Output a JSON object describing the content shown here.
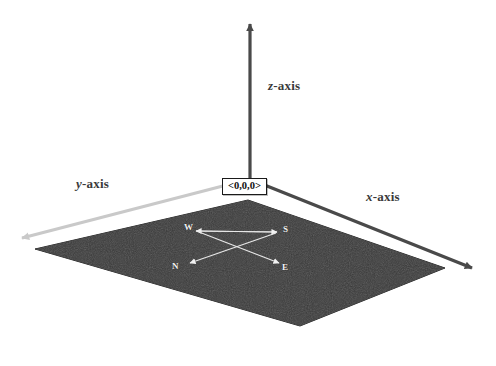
{
  "figure": {
    "type": "3d-coordinate-system-diagram",
    "background_color": "#ffffff"
  },
  "origin": {
    "name": "origin-marker",
    "label": "<0,0,0>",
    "box_fill": "#ffffff",
    "box_border": "#1a1a1a",
    "position": {
      "x": 248,
      "y": 184
    }
  },
  "axes": [
    {
      "key": "z",
      "name": "z-axis",
      "label_prefix": "z",
      "label_suffix": "-axis",
      "color": "#4a4a4a",
      "direction": "up",
      "arrow_tip": {
        "x": 252,
        "y": 16
      },
      "label_position": {
        "x": 268,
        "y": 78
      }
    },
    {
      "key": "y",
      "name": "y-axis",
      "label_prefix": "y",
      "label_suffix": "-axis",
      "color": "#c9c9c9",
      "direction": "down-left",
      "arrow_tip": {
        "x": 16,
        "y": 240
      },
      "label_position": {
        "x": 76,
        "y": 176
      }
    },
    {
      "key": "x",
      "name": "x-axis",
      "label_prefix": "x",
      "label_suffix": "-axis",
      "color": "#4a4a4a",
      "direction": "down-right",
      "arrow_tip": {
        "x": 478,
        "y": 272
      },
      "label_position": {
        "x": 366,
        "y": 189
      }
    }
  ],
  "ground_plane": {
    "name": "ground-plane",
    "shape": "quadrilateral",
    "fill_color": "#3a3a3a",
    "edge_color": "#2b2b2b",
    "corners": [
      {
        "x": 248,
        "y": 200
      },
      {
        "x": 445,
        "y": 268
      },
      {
        "x": 300,
        "y": 326
      },
      {
        "x": 35,
        "y": 249
      }
    ]
  },
  "compass": {
    "name": "compass-rose",
    "color": "#f2f2f2",
    "center": {
      "x": 237,
      "y": 248
    },
    "directions": [
      {
        "key": "w",
        "label": "W",
        "label_position": {
          "x": 184,
          "y": 222
        },
        "arrow_tip": {
          "x": 199,
          "y": 231
        }
      },
      {
        "key": "s",
        "label": "S",
        "label_position": {
          "x": 283,
          "y": 224
        },
        "arrow_tip": {
          "x": 276,
          "y": 231
        }
      },
      {
        "key": "n",
        "label": "N",
        "label_position": {
          "x": 172,
          "y": 261
        },
        "arrow_tip": {
          "x": 188,
          "y": 262
        }
      },
      {
        "key": "e",
        "label": "E",
        "label_position": {
          "x": 282,
          "y": 262
        },
        "arrow_tip": {
          "x": 277,
          "y": 262
        }
      }
    ]
  }
}
